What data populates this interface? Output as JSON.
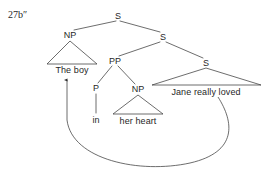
{
  "figure": {
    "example_number": "27b″",
    "caption_position": "top-left",
    "background_color": "#ffffff",
    "line_color": "#3c3c3c",
    "text_color": "#1f1f1f"
  },
  "tree": {
    "nodes": [
      {
        "id": "s-root",
        "label": "S",
        "x": 118,
        "y": 16,
        "type": "nonterminal"
      },
      {
        "id": "np-subject",
        "label": "NP",
        "x": 70,
        "y": 35,
        "type": "nonterminal"
      },
      {
        "id": "s-level2",
        "label": "S",
        "x": 163,
        "y": 37,
        "type": "nonterminal"
      },
      {
        "id": "pp",
        "label": "PP",
        "x": 115,
        "y": 61,
        "type": "nonterminal"
      },
      {
        "id": "s-level3",
        "label": "S",
        "x": 206,
        "y": 63,
        "type": "nonterminal"
      },
      {
        "id": "p-prep",
        "label": "P",
        "x": 96,
        "y": 88,
        "type": "nonterminal"
      },
      {
        "id": "np-object",
        "label": "NP",
        "x": 138,
        "y": 89,
        "type": "nonterminal"
      }
    ],
    "terminals": [
      {
        "id": "t-the-boy",
        "label": "The boy",
        "x": 72,
        "y": 70,
        "triangle": true,
        "parent": "np-subject",
        "span": [
          48,
          97
        ]
      },
      {
        "id": "t-jane",
        "label": "Jane really loved",
        "x": 206,
        "y": 92,
        "triangle": true,
        "parent": "s-level3",
        "span": [
          152,
          261
        ]
      },
      {
        "id": "t-in",
        "label": "in",
        "x": 96,
        "y": 120,
        "triangle": false,
        "parent": "p-prep",
        "span": [
          92,
          101
        ]
      },
      {
        "id": "t-her-heart",
        "label": "her heart",
        "x": 138,
        "y": 121,
        "triangle": true,
        "parent": "np-object",
        "span": [
          113,
          163
        ]
      }
    ],
    "movement_arrow": {
      "id": "movement-arrow",
      "from_label": "Jane really loved",
      "to_label": "The boy",
      "direction": "leftward-raising",
      "head_x": 67,
      "head_y": 74
    }
  }
}
